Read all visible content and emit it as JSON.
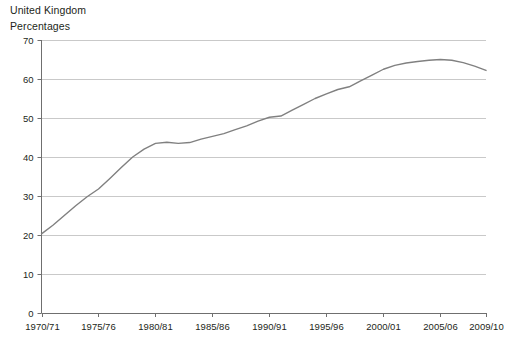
{
  "header": {
    "title": "United Kingdom",
    "subtitle": "Percentages"
  },
  "chart_data": {
    "type": "line",
    "title": "United Kingdom",
    "subtitle": "Percentages",
    "xlabel": "",
    "ylabel": "Percentages",
    "ylim": [
      0,
      70
    ],
    "ytick_values": [
      0,
      10,
      20,
      30,
      40,
      50,
      60,
      70
    ],
    "ytick_labels": [
      "0",
      "10",
      "20",
      "30",
      "40",
      "50",
      "60",
      "70"
    ],
    "xtick_labels": [
      "1970/71",
      "1975/76",
      "1980/81",
      "1985/86",
      "1990/91",
      "1995/96",
      "2000/01",
      "2005/06",
      "2009/10"
    ],
    "xtick_values": [
      "1970/71",
      "1975/76",
      "1980/81",
      "1985/86",
      "1990/91",
      "1995/96",
      "2000/01",
      "2005/06",
      "2009/10"
    ],
    "grid": "horizontal",
    "legend": "none",
    "line_color": "#808080",
    "x": [
      "1970/71",
      "1971/72",
      "1972/73",
      "1973/74",
      "1974/75",
      "1975/76",
      "1976/77",
      "1977/78",
      "1978/79",
      "1979/80",
      "1980/81",
      "1981/82",
      "1982/83",
      "1983/84",
      "1984/85",
      "1985/86",
      "1986/87",
      "1987/88",
      "1988/89",
      "1989/90",
      "1990/91",
      "1991/92",
      "1992/93",
      "1993/94",
      "1994/95",
      "1995/96",
      "1996/97",
      "1997/98",
      "1998/99",
      "1999/00",
      "2000/01",
      "2001/02",
      "2002/03",
      "2003/04",
      "2004/05",
      "2005/06",
      "2006/07",
      "2007/08",
      "2008/09",
      "2009/10"
    ],
    "series": [
      {
        "name": "Percentage",
        "values": [
          20.3,
          22.5,
          25.0,
          27.5,
          29.8,
          31.8,
          34.5,
          37.3,
          40.0,
          42.0,
          43.5,
          43.8,
          43.5,
          43.7,
          44.6,
          45.3,
          46.0,
          47.0,
          48.0,
          49.2,
          50.2,
          50.5,
          52.0,
          53.5,
          55.0,
          56.2,
          57.3,
          58.0,
          59.5,
          61.0,
          62.5,
          63.5,
          64.1,
          64.5,
          64.8,
          65.0,
          64.8,
          64.2,
          63.3,
          62.2
        ]
      }
    ]
  }
}
